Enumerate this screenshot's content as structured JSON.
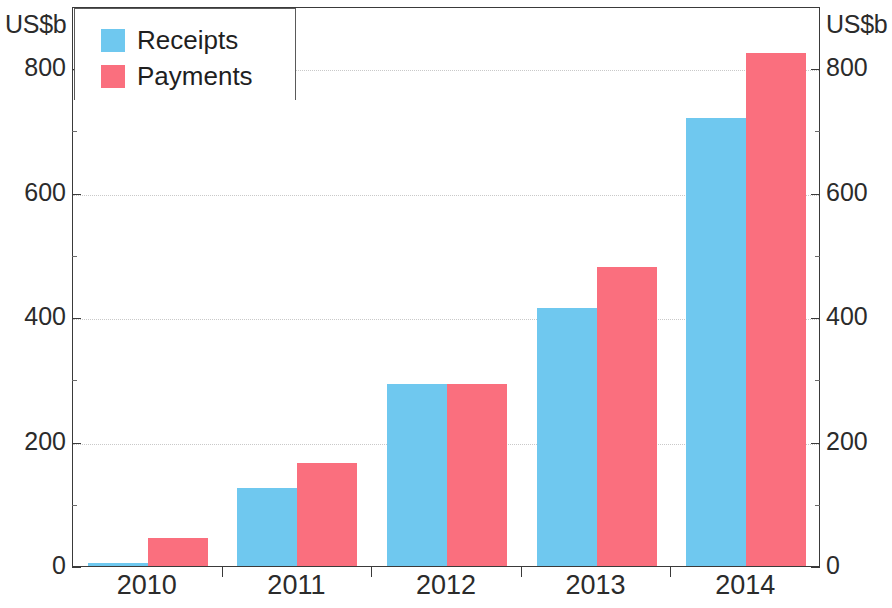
{
  "axis": {
    "unit_left": "US$b",
    "unit_right": "US$b",
    "y_ticks": [
      "0",
      "200",
      "400",
      "600",
      "800"
    ],
    "x_ticks": [
      "2010",
      "2011",
      "2012",
      "2013",
      "2014"
    ]
  },
  "legend": {
    "items": [
      {
        "label": "Receipts",
        "color": "#6fc8ef"
      },
      {
        "label": "Payments",
        "color": "#fa6f7e"
      }
    ]
  },
  "colors": {
    "receipts": "#6fc8ef",
    "payments": "#fa6f7e",
    "frame": "#3a3a3a",
    "grid": "#c9c9c9",
    "text": "#2b2b2b"
  },
  "chart_data": {
    "type": "bar",
    "title": "",
    "subtitle": "",
    "xlabel": "",
    "ylabel": "US$b",
    "ylabel_right": "US$b",
    "categories": [
      "2010",
      "2011",
      "2012",
      "2013",
      "2014"
    ],
    "series": [
      {
        "name": "Receipts",
        "color": "#6fc8ef",
        "values": [
          5,
          125,
          292,
          415,
          720
        ]
      },
      {
        "name": "Payments",
        "color": "#fa6f7e",
        "values": [
          45,
          165,
          292,
          480,
          825
        ]
      }
    ],
    "ylim": [
      0,
      900
    ],
    "y_ticks": [
      0,
      200,
      400,
      600,
      800
    ],
    "y_minor_ticks": [
      100,
      300,
      500,
      700
    ],
    "grid": true,
    "grid_axis": "y",
    "grid_style": "dotted",
    "legend_position": "top-left",
    "dual_axis": true,
    "annotations": []
  }
}
